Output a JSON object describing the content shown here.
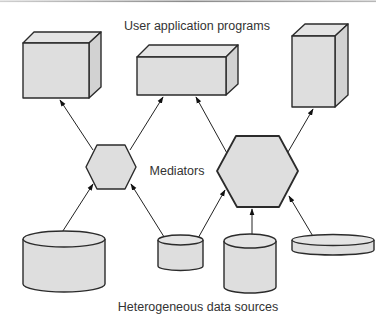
{
  "labels": {
    "top": "User application programs",
    "middle": "Mediators",
    "bottom": "Heterogeneous data sources"
  },
  "colors": {
    "fill": "#dedede",
    "stroke": "#2b2b2b",
    "text": "#333333",
    "top_rule": "#9a9a9a"
  },
  "nodes": {
    "applications": [
      {
        "id": "app-1",
        "shape": "box"
      },
      {
        "id": "app-2",
        "shape": "box"
      },
      {
        "id": "app-3",
        "shape": "box"
      }
    ],
    "mediators": [
      {
        "id": "mediator-small",
        "shape": "hexagon"
      },
      {
        "id": "mediator-large",
        "shape": "hexagon"
      }
    ],
    "sources": [
      {
        "id": "source-1",
        "shape": "cylinder"
      },
      {
        "id": "source-2",
        "shape": "cylinder"
      },
      {
        "id": "source-3",
        "shape": "cylinder"
      },
      {
        "id": "source-4",
        "shape": "cylinder"
      }
    ]
  },
  "edges": [
    {
      "from": "mediator-small",
      "to": "app-1"
    },
    {
      "from": "mediator-small",
      "to": "app-2"
    },
    {
      "from": "mediator-large",
      "to": "app-2"
    },
    {
      "from": "mediator-large",
      "to": "app-3"
    },
    {
      "from": "source-1",
      "to": "mediator-small"
    },
    {
      "from": "source-2",
      "to": "mediator-small"
    },
    {
      "from": "source-2",
      "to": "mediator-large"
    },
    {
      "from": "source-3",
      "to": "mediator-large"
    },
    {
      "from": "source-4",
      "to": "mediator-large"
    }
  ]
}
